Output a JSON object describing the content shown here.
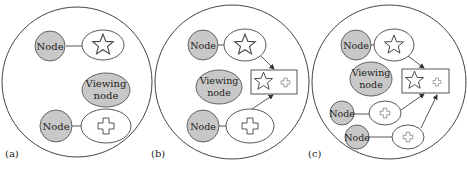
{
  "panels": [
    {
      "label": "(a)",
      "node1": "Node",
      "node2": "Node",
      "viewing_line1": "Viewing",
      "viewing_line2": "node"
    },
    {
      "label": "(b)",
      "node1": "Node",
      "node2": "Node",
      "viewing_line1": "Viewing",
      "viewing_line2": "node"
    },
    {
      "label": "(c)",
      "node1": "Node",
      "node2": "Node",
      "node3": "Node",
      "viewing_line1": "Viewing",
      "viewing_line2": "node"
    }
  ],
  "colors": {
    "node_fill": "#c8c8c8",
    "stroke": "#444444"
  }
}
